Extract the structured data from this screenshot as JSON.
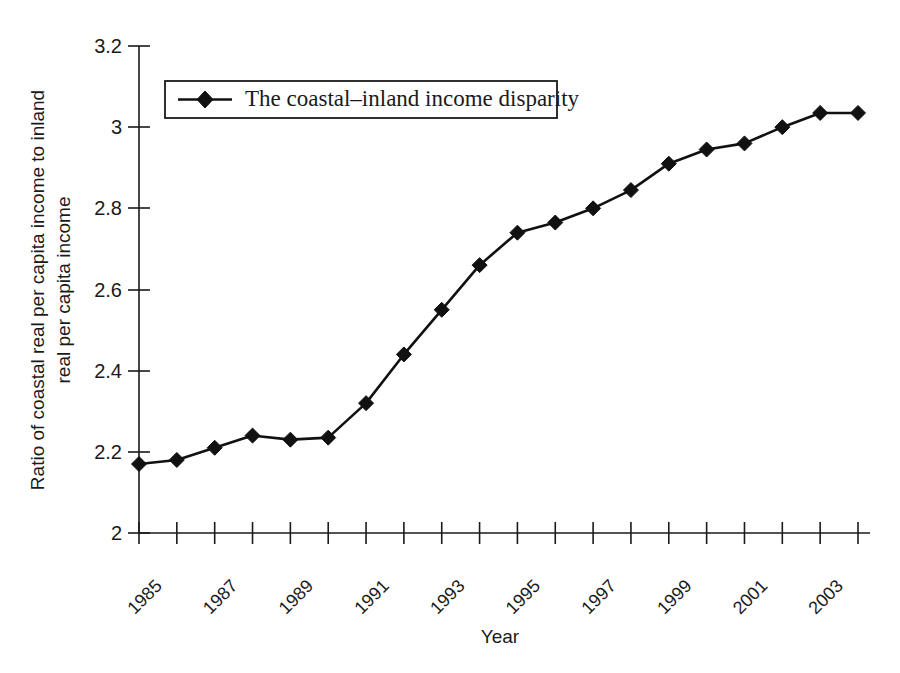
{
  "chart_data": {
    "type": "line",
    "title": "",
    "xlabel": "Year",
    "ylabel": "Ratio of coastal real per capita income to inland real per capita income",
    "ylabel_line1": "Ratio of coastal real per capita income to inland",
    "ylabel_line2": "real per capita income",
    "ylim": [
      2,
      3.2
    ],
    "xlim": [
      1985,
      2004
    ],
    "grid": false,
    "legend_position": "top-left-inside",
    "y_ticks": [
      "2",
      "2.2",
      "2.4",
      "2.6",
      "2.8",
      "3",
      "3.2"
    ],
    "y_tick_values": [
      2,
      2.2,
      2.4,
      2.6,
      2.8,
      3.0,
      3.2
    ],
    "x_tick_values": [
      1985,
      1986,
      1987,
      1988,
      1989,
      1990,
      1991,
      1992,
      1993,
      1994,
      1995,
      1996,
      1997,
      1998,
      1999,
      2000,
      2001,
      2002,
      2003,
      2004
    ],
    "x_tick_labels": [
      "1985",
      "",
      "1987",
      "",
      "1989",
      "",
      "1991",
      "",
      "1993",
      "",
      "1995",
      "",
      "1997",
      "",
      "1999",
      "",
      "2001",
      "",
      "2003",
      ""
    ],
    "series": [
      {
        "name": "The coastal–inland income disparity",
        "color": "#111111",
        "marker": "diamond",
        "x": [
          1985,
          1986,
          1987,
          1988,
          1989,
          1990,
          1991,
          1992,
          1993,
          1994,
          1995,
          1996,
          1997,
          1998,
          1999,
          2000,
          2001,
          2002,
          2003,
          2004
        ],
        "values": [
          2.17,
          2.18,
          2.21,
          2.24,
          2.23,
          2.235,
          2.32,
          2.44,
          2.55,
          2.66,
          2.74,
          2.765,
          2.8,
          2.845,
          2.91,
          2.945,
          2.96,
          3.0,
          3.035,
          3.035
        ]
      }
    ]
  },
  "legend": {
    "entries": [
      {
        "label": "The coastal–inland income disparity"
      }
    ]
  },
  "axes": {
    "x_title": "Year",
    "y_title_line1": "Ratio of coastal real per capita income to inland",
    "y_title_line2": "real per capita income"
  }
}
